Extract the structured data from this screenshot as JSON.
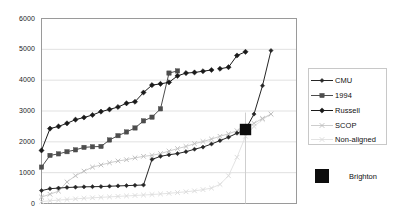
{
  "chart_data": {
    "type": "line",
    "title": "",
    "xlabel": "",
    "ylabel": "",
    "ylim": [
      0,
      6000
    ],
    "xlim": [
      0,
      30
    ],
    "grid": true,
    "grid_axis": "y",
    "legend_position": "right",
    "ytick_labels": [
      "6000",
      "5000",
      "4000",
      "3000",
      "2000",
      "1000",
      "0"
    ],
    "ytick_values": [
      6000,
      5000,
      4000,
      3000,
      2000,
      1000,
      0
    ],
    "xtick_labels": [],
    "series": [
      {
        "name": "Russell",
        "color": "#1a1a1a",
        "marker": "diamond",
        "x": [
          0,
          1,
          2,
          3,
          4,
          5,
          6,
          7,
          8,
          9,
          10,
          11,
          12,
          13,
          14,
          15,
          16,
          17,
          18,
          19,
          20
        ],
        "values": [
          1720,
          2430,
          2500,
          2600,
          2720,
          2790,
          2870,
          2980,
          3050,
          3130,
          3250,
          3300,
          3600,
          3840,
          3880,
          3930,
          4140,
          4230,
          4250,
          4290,
          4330
        ]
      },
      {
        "name": "Russell-upper-right",
        "color": "#1a1a1a",
        "marker": "diamond",
        "x": [
          21,
          22,
          23,
          24
        ],
        "values": [
          4370,
          4420,
          4800,
          4920
        ]
      },
      {
        "name": "1994",
        "color": "#4d4d4d",
        "marker": "square",
        "x": [
          0,
          1,
          2,
          3,
          4,
          5,
          6,
          7,
          8,
          9,
          10,
          11,
          12,
          13,
          14,
          15,
          16
        ],
        "values": [
          1180,
          1560,
          1610,
          1680,
          1740,
          1820,
          1840,
          1850,
          2060,
          2200,
          2320,
          2450,
          2680,
          2800,
          3070,
          4230,
          4300
        ]
      },
      {
        "name": "CMU",
        "color": "#262626",
        "marker": "small-diamond",
        "x": [
          0,
          1,
          2,
          3,
          4,
          5,
          6,
          7,
          8,
          9,
          10,
          11,
          12,
          13,
          14,
          15,
          16,
          17,
          18,
          19,
          20,
          21,
          22,
          23,
          24,
          25,
          26,
          27
        ],
        "values": [
          420,
          480,
          500,
          520,
          530,
          540,
          545,
          550,
          560,
          570,
          580,
          590,
          600,
          1430,
          1530,
          1580,
          1620,
          1680,
          1760,
          1830,
          1930,
          2040,
          2150,
          2280,
          2400,
          2900,
          3820,
          4960
        ]
      },
      {
        "name": "SCOP",
        "color": "#c0c0c0",
        "marker": "x",
        "x": [
          0,
          1,
          2,
          3,
          4,
          5,
          6,
          7,
          8,
          9,
          10,
          11,
          12,
          13,
          14,
          15,
          16,
          17,
          18,
          19,
          20,
          21,
          22,
          23,
          24,
          25,
          26,
          27
        ],
        "values": [
          210,
          300,
          400,
          700,
          900,
          1050,
          1180,
          1250,
          1320,
          1380,
          1420,
          1480,
          1530,
          1560,
          1620,
          1700,
          1780,
          1850,
          1940,
          2010,
          2090,
          2180,
          2260,
          2360,
          2440,
          2600,
          2760,
          2900
        ]
      },
      {
        "name": "Non-aligned",
        "color": "#dcdcdc",
        "marker": "x",
        "x": [
          0,
          1,
          2,
          3,
          4,
          5,
          6,
          7,
          8,
          9,
          10,
          11,
          12,
          13,
          14,
          15,
          16,
          17,
          18,
          19,
          20,
          21,
          22,
          23,
          24,
          25,
          26,
          27
        ],
        "values": [
          60,
          90,
          110,
          130,
          150,
          170,
          185,
          200,
          215,
          230,
          245,
          260,
          275,
          290,
          310,
          330,
          355,
          380,
          410,
          450,
          500,
          620,
          900,
          1500,
          2180,
          2500,
          2720,
          2900
        ]
      }
    ],
    "point_markers": [
      {
        "name": "Brighton",
        "color": "#0d0d0d",
        "marker": "large-square",
        "x": 24,
        "value": 2400
      }
    ]
  },
  "legend": {
    "entries": [
      {
        "label": "CMU",
        "marker": "small-diamond",
        "color": "#262626"
      },
      {
        "label": "1994",
        "marker": "square",
        "color": "#4d4d4d"
      },
      {
        "label": "Russell",
        "marker": "diamond",
        "color": "#1a1a1a"
      },
      {
        "label": "SCOP",
        "marker": "x",
        "color": "#c0c0c0"
      },
      {
        "label": "Non-aligned",
        "marker": "x",
        "color": "#dcdcdc"
      }
    ]
  },
  "brighton_legend": {
    "label": "Brighton",
    "color": "#0d0d0d"
  },
  "axis": {
    "y_labels": [
      "6000",
      "5000",
      "4000",
      "3000",
      "2000",
      "1000",
      "0"
    ]
  }
}
